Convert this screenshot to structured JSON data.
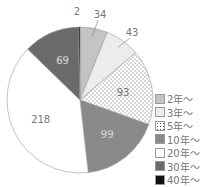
{
  "chart_data": {
    "type": "pie",
    "title": "",
    "start_angle_deg": 0,
    "direction": "clockwise",
    "slices": [
      {
        "label": "2年～",
        "value": 34,
        "color": "#c4c4c4",
        "pattern": "none",
        "label_pos": "outside"
      },
      {
        "label": "3年～",
        "value": 43,
        "color": "#ececec",
        "pattern": "none",
        "label_pos": "outside"
      },
      {
        "label": "5年～",
        "value": 93,
        "color": "#ffffff",
        "pattern": "dots",
        "label_pos": "inside"
      },
      {
        "label": "10年～",
        "value": 99,
        "color": "#8a8a8a",
        "pattern": "none",
        "label_pos": "inside"
      },
      {
        "label": "20年～",
        "value": 218,
        "color": "#ffffff",
        "pattern": "none",
        "label_pos": "inside"
      },
      {
        "label": "30年～",
        "value": 69,
        "color": "#6a6a6a",
        "pattern": "none",
        "label_pos": "inside"
      },
      {
        "label": "40年～",
        "value": 2,
        "color": "#111111",
        "pattern": "none",
        "label_pos": "outside"
      }
    ],
    "legend": {
      "position": "right-bottom",
      "order": [
        "2年～",
        "3年～",
        "5年～",
        "10年～",
        "20年～",
        "30年～",
        "40年～"
      ]
    },
    "total": 558
  }
}
